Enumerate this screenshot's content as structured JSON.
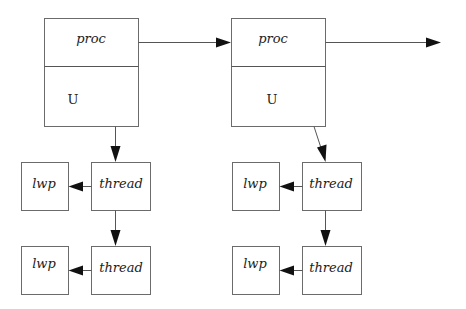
{
  "diagram": {
    "type": "process-thread-lwp structure",
    "processes": [
      {
        "id": "proc1",
        "top_label": "proc",
        "bottom_label": "U",
        "threads": [
          {
            "label": "thread",
            "lwp": "lwp"
          },
          {
            "label": "thread",
            "lwp": "lwp"
          }
        ]
      },
      {
        "id": "proc2",
        "top_label": "proc",
        "bottom_label": "U",
        "threads": [
          {
            "label": "thread",
            "lwp": "lwp"
          },
          {
            "label": "thread",
            "lwp": "lwp"
          }
        ]
      }
    ],
    "edges": [
      {
        "from": "proc1",
        "to": "proc2"
      },
      {
        "from": "proc2",
        "to": "next (off-diagram)"
      },
      {
        "from": "proc1.U",
        "to": "proc1.thread1"
      },
      {
        "from": "proc1.thread1",
        "to": "proc1.thread2"
      },
      {
        "from": "proc1.thread1",
        "to": "proc1.lwp1"
      },
      {
        "from": "proc1.thread2",
        "to": "proc1.lwp2"
      },
      {
        "from": "proc2.U",
        "to": "proc2.thread1"
      },
      {
        "from": "proc2.thread1",
        "to": "proc2.thread2"
      },
      {
        "from": "proc2.thread1",
        "to": "proc2.lwp1"
      },
      {
        "from": "proc2.thread2",
        "to": "proc2.lwp2"
      }
    ],
    "colors": {
      "stroke": "#6b6b6b",
      "arrowhead": "#111111",
      "text": "#222222",
      "background": "#ffffff"
    }
  }
}
